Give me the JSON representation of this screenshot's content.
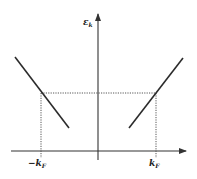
{
  "diagram": {
    "type": "dispersion-relation",
    "y_axis_label": "ε",
    "y_axis_label_subscript": "k",
    "x_tick_labels": [
      {
        "main": "−k",
        "sub": "F"
      },
      {
        "main": "k",
        "sub": "F"
      }
    ],
    "colors": {
      "line": "#2b2b2b",
      "axis": "#333333",
      "dotted": "#444444"
    }
  }
}
